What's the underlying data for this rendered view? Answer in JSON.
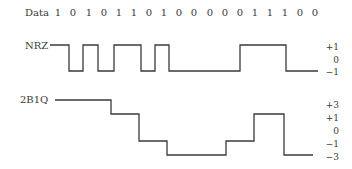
{
  "data_row": {
    "label": "Data",
    "bits": [
      "1",
      "0",
      "1",
      "0",
      "1",
      "1",
      "0",
      "1",
      "0",
      "0",
      "0",
      "0",
      "0",
      "1",
      "1",
      "1",
      "0",
      "0"
    ]
  },
  "nrz": {
    "label": "NRZ",
    "levels": [
      "+1",
      "0",
      "−1"
    ]
  },
  "twob1q": {
    "label": "2B1Q",
    "levels": [
      "+3",
      "+1",
      "0",
      "−1",
      "−3"
    ]
  },
  "colors": {
    "line": "#3a3a3a",
    "text": "#3a3a3a"
  }
}
